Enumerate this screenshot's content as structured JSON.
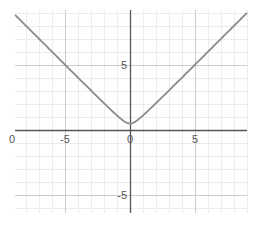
{
  "chart_data": {
    "type": "line",
    "title": "",
    "xlabel": "",
    "ylabel": "",
    "xlim": [
      -8.8,
      9.0
    ],
    "ylim": [
      -6.4,
      9.2
    ],
    "grid": true,
    "minor_grid_step": 1,
    "major_grid_step": 5,
    "x_ticks": [
      {
        "value": -10,
        "label": "0"
      },
      {
        "value": -5,
        "label": "-5"
      },
      {
        "value": 0,
        "label": "0"
      },
      {
        "value": 5,
        "label": "5"
      }
    ],
    "y_ticks": [
      {
        "value": 5,
        "label": "5"
      },
      {
        "value": -5,
        "label": "-5"
      }
    ],
    "series": [
      {
        "name": "f(x)",
        "expression": "sqrt(x^2 + 0.25)",
        "color": "#8a8a8a",
        "x": [
          -8.8,
          -8,
          -7,
          -6,
          -5,
          -4,
          -3,
          -2,
          -1.5,
          -1,
          -0.5,
          0,
          0.5,
          1,
          1.5,
          2,
          3,
          4,
          5,
          6,
          7,
          8,
          9
        ],
        "y": [
          8.81,
          8.02,
          7.02,
          6.02,
          5.02,
          4.03,
          3.04,
          2.06,
          1.58,
          1.12,
          0.71,
          0.5,
          0.71,
          1.12,
          1.58,
          2.06,
          3.04,
          4.03,
          5.02,
          6.02,
          7.02,
          8.02,
          9.01
        ]
      }
    ],
    "colors": {
      "axis": "#555555",
      "major_grid": "#cccccc",
      "minor_grid": "#ececec",
      "curve": "#8a8a8a"
    }
  }
}
